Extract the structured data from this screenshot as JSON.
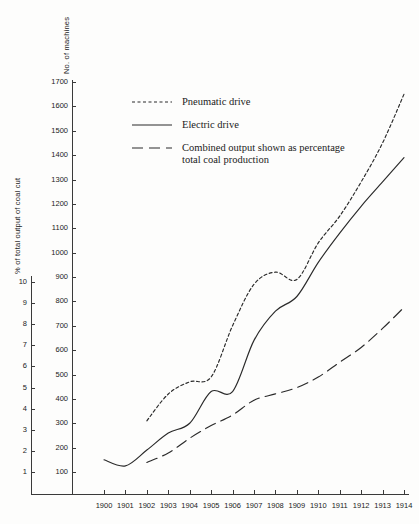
{
  "chart_data": {
    "type": "line",
    "title": "",
    "xlabel": "",
    "x": [
      1900,
      1901,
      1902,
      1903,
      1904,
      1905,
      1906,
      1907,
      1908,
      1909,
      1910,
      1911,
      1912,
      1913,
      1914
    ],
    "xlim": [
      1900,
      1914
    ],
    "xtick_labels": [
      "1900",
      "1901",
      "1902",
      "1903",
      "1904",
      "1905",
      "1906",
      "1907",
      "1908",
      "1909",
      "1910",
      "1911",
      "1912",
      "1913",
      "1914"
    ],
    "grid": false,
    "legend_position": "upper-left",
    "axes": [
      {
        "id": "machines",
        "label": "No. of machines",
        "position": "left-inner",
        "ylim": [
          0,
          1750
        ],
        "ticks": [
          100,
          200,
          300,
          400,
          500,
          600,
          700,
          800,
          900,
          1000,
          1100,
          1200,
          1300,
          1400,
          1500,
          1600,
          1700
        ],
        "tick_labels": [
          "100",
          "200",
          "300",
          "400",
          "500",
          "600",
          "700",
          "800",
          "900",
          "1000",
          "1100",
          "1200",
          "1300",
          "1400",
          "1500",
          "1600",
          "1700"
        ]
      },
      {
        "id": "percent",
        "label": "% of total output of coal cut",
        "position": "left-outer",
        "ylim": [
          0,
          10.3
        ],
        "ticks": [
          1,
          2,
          3,
          4,
          5,
          6,
          7,
          8,
          9,
          10
        ],
        "tick_labels": [
          "1",
          "2",
          "3",
          "4",
          "5",
          "6",
          "7",
          "8",
          "9",
          "10"
        ]
      }
    ],
    "series": [
      {
        "name": "Pneumatic drive",
        "axis": "machines",
        "style": "dotted",
        "x": [
          1902,
          1903,
          1904,
          1905,
          1906,
          1907,
          1908,
          1909,
          1910,
          1911,
          1912,
          1913,
          1914
        ],
        "values": [
          310,
          420,
          470,
          490,
          700,
          870,
          920,
          890,
          1040,
          1150,
          1290,
          1450,
          1650
        ]
      },
      {
        "name": "Electric drive",
        "axis": "machines",
        "style": "solid",
        "x": [
          1900,
          1901,
          1902,
          1903,
          1904,
          1905,
          1906,
          1907,
          1908,
          1909,
          1910,
          1911,
          1912,
          1913,
          1914
        ],
        "values": [
          150,
          125,
          190,
          260,
          300,
          430,
          430,
          640,
          760,
          820,
          960,
          1080,
          1190,
          1290,
          1390
        ]
      },
      {
        "name": "Combined output shown as percentage total coal production",
        "axis": "percent",
        "style": "dashed",
        "x": [
          1902,
          1903,
          1904,
          1905,
          1906,
          1907,
          1908,
          1909,
          1910,
          1911,
          1912,
          1913,
          1914
        ],
        "values": [
          1.45,
          1.9,
          2.6,
          3.2,
          3.7,
          4.4,
          4.7,
          5.0,
          5.5,
          6.2,
          6.9,
          7.8,
          8.8
        ]
      }
    ]
  },
  "legend": {
    "items": [
      {
        "label": "Pneumatic drive",
        "style": "dotted"
      },
      {
        "label": "Electric drive",
        "style": "solid"
      },
      {
        "label": "Combined output shown as percentage\ntotal coal production",
        "style": "dashed"
      }
    ]
  }
}
